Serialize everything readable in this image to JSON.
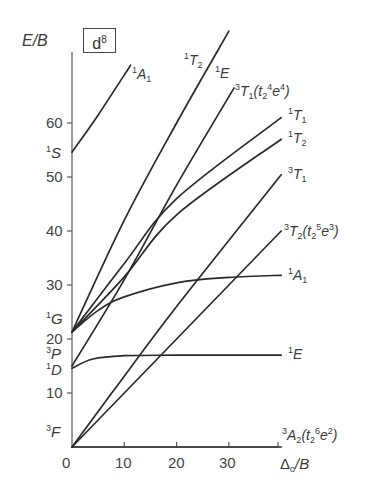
{
  "chart_data": {
    "type": "line",
    "title": "d8",
    "subtitle": "Tanabe–Sugano diagram",
    "xlabel": "Δo/B",
    "ylabel": "E/B",
    "xlim": [
      0,
      39
    ],
    "ylim": [
      0,
      73
    ],
    "x_ticks": [
      0,
      10,
      20,
      30
    ],
    "y_ticks": [
      10,
      20,
      30,
      40,
      50,
      60
    ],
    "grid": false,
    "free_ion_terms": [
      {
        "term": "3F",
        "E": 0
      },
      {
        "term": "1D",
        "E": 14.6
      },
      {
        "term": "3P",
        "E": 15.0
      },
      {
        "term": "1G",
        "E": 21.3
      },
      {
        "term": "1S",
        "E": 54.6
      }
    ],
    "series": [
      {
        "name": "3A2 (t2^6 e^2)",
        "points": [
          [
            0,
            0
          ],
          [
            40,
            0
          ]
        ]
      },
      {
        "name": "3T2 (t2^5 e^3)",
        "points": [
          [
            0,
            0
          ],
          [
            40,
            40
          ]
        ]
      },
      {
        "name": "3T1",
        "points": [
          [
            0,
            0
          ],
          [
            8,
            10.5
          ],
          [
            20,
            26
          ],
          [
            40,
            50.4
          ]
        ]
      },
      {
        "name": "1E",
        "points": [
          [
            0,
            14.6
          ],
          [
            4,
            16.3
          ],
          [
            10,
            16.9
          ],
          [
            20,
            17.0
          ],
          [
            40,
            17.0
          ]
        ]
      },
      {
        "name": "3T1 (t2^4 e^4)",
        "points": [
          [
            0,
            15.0
          ],
          [
            10,
            31
          ],
          [
            20,
            48.5
          ],
          [
            31,
            66.5
          ]
        ]
      },
      {
        "name": "1A1",
        "points": [
          [
            0,
            21.3
          ],
          [
            5,
            25.3
          ],
          [
            10,
            27.8
          ],
          [
            20,
            30.4
          ],
          [
            30,
            31.4
          ],
          [
            40,
            31.8
          ]
        ]
      },
      {
        "name": "1T2",
        "points": [
          [
            0,
            21.3
          ],
          [
            10,
            31.5
          ],
          [
            20,
            43
          ],
          [
            40,
            57
          ]
        ]
      },
      {
        "name": "1T1",
        "points": [
          [
            0,
            21.3
          ],
          [
            10,
            34
          ],
          [
            20,
            46
          ],
          [
            40,
            61
          ]
        ]
      },
      {
        "name": "1T2 / 1E",
        "points": [
          [
            0,
            21.3
          ],
          [
            10,
            42
          ],
          [
            20,
            60
          ],
          [
            30,
            77
          ]
        ]
      },
      {
        "name": "1A1 (from 1S)",
        "points": [
          [
            0,
            54.6
          ],
          [
            5,
            61.5
          ],
          [
            11.2,
            70.7
          ]
        ]
      }
    ],
    "annotations": [
      "1A1",
      "1T2",
      "1E",
      "3T1(t2^4e^4)",
      "1T1",
      "1T2",
      "3T1",
      "3T2(t2^5e^3)",
      "1A1",
      "1E",
      "3A2(t2^6e^2)"
    ]
  },
  "labels": {
    "ylabel": "E/B",
    "xlabel_delta": "Δ",
    "xlabel_sub": "o",
    "xlabel_rest": "/B",
    "box_letter": "d",
    "box_sup": "8"
  },
  "ticks": {
    "x": [
      "0",
      "10",
      "20",
      "30"
    ],
    "y": [
      "10",
      "20",
      "30",
      "40",
      "50",
      "60"
    ]
  }
}
